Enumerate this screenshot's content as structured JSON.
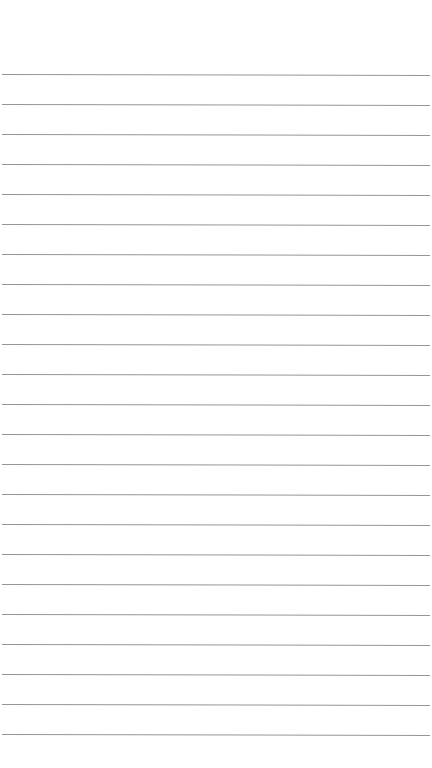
{
  "page": {
    "type": "blank lined paper",
    "background_color": "#ffffff",
    "line_color": "#8a8a8a",
    "line_count": 23,
    "first_line_y": 74,
    "line_spacing": 30
  }
}
